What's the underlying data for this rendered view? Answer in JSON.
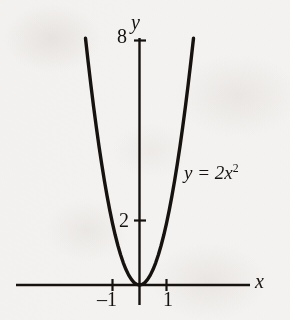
{
  "figure": {
    "background_color": "#f8f7f6",
    "ink_color": "#16120f"
  },
  "chart_data": {
    "type": "line",
    "title": "",
    "subtitle": "",
    "xlabel": "x",
    "ylabel": "y",
    "equation": "y = 2x",
    "equation_exponent": "2",
    "equation_full": "y = 2x²",
    "function": "y = 2*x^2",
    "grid": false,
    "legend": "none",
    "annotations": [
      {
        "text": "y = 2x²",
        "x": 2.1,
        "y": 4.4
      }
    ],
    "xlim": [
      -2.35,
      2.35
    ],
    "ylim": [
      -0.65,
      8.7
    ],
    "x_ticks": [
      -1,
      1
    ],
    "x_tick_labels": [
      "–1",
      "1"
    ],
    "y_ticks": [
      2,
      8
    ],
    "y_tick_labels": [
      "2",
      "8"
    ],
    "x_axis_label": "x",
    "y_axis_label": "y",
    "x": [
      -2.0,
      -1.9,
      -1.8,
      -1.7,
      -1.6,
      -1.5,
      -1.4,
      -1.3,
      -1.2,
      -1.1,
      -1.0,
      -0.9,
      -0.8,
      -0.7,
      -0.6,
      -0.5,
      -0.4,
      -0.3,
      -0.2,
      -0.1,
      0.0,
      0.1,
      0.2,
      0.3,
      0.4,
      0.5,
      0.6,
      0.7,
      0.8,
      0.9,
      1.0,
      1.1,
      1.2,
      1.3,
      1.4,
      1.5,
      1.6,
      1.7,
      1.8,
      1.9,
      2.0
    ],
    "values": [
      8.0,
      7.22,
      6.48,
      5.78,
      5.12,
      4.5,
      3.92,
      3.38,
      2.88,
      2.42,
      2.0,
      1.62,
      1.28,
      0.98,
      0.72,
      0.5,
      0.32,
      0.18,
      0.08,
      0.02,
      0.0,
      0.02,
      0.08,
      0.18,
      0.32,
      0.5,
      0.72,
      0.98,
      1.28,
      1.62,
      2.0,
      2.42,
      2.88,
      3.38,
      3.92,
      4.5,
      5.12,
      5.78,
      6.48,
      7.22,
      8.0
    ],
    "vertex": {
      "x": 0,
      "y": 0
    },
    "curve_color": "#16120f",
    "curve_width": 3.4
  },
  "labels": {
    "y_tick_8": "8",
    "y_tick_2": "2",
    "y_axis_name": "y",
    "x_tick_neg1": "–1",
    "x_tick_1": "1",
    "x_axis_name": "x",
    "equation_base": "y = 2x",
    "equation_exp": "2"
  }
}
